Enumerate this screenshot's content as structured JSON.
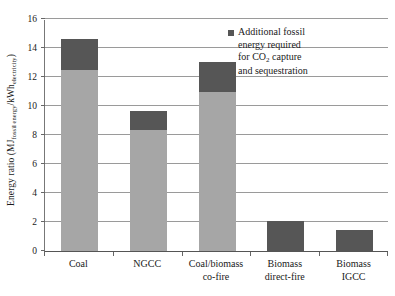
{
  "chart_data": {
    "type": "bar",
    "title": "",
    "xlabel": "",
    "ylabel": "Energy ratio (MJfossil energy/kWhelectricity)",
    "ylabel_parts": {
      "main_prefix": "Energy ratio (MJ",
      "sub1": "fossil energy",
      "mid": "/kWh",
      "sub2": "electricity",
      "suffix": ")"
    },
    "ylim": [
      0,
      16
    ],
    "yticks": [
      0,
      2,
      4,
      6,
      8,
      10,
      12,
      14,
      16
    ],
    "ytick_labels": [
      "0",
      "2",
      "4",
      "6",
      "8",
      "10",
      "12",
      "14",
      "16"
    ],
    "grid": true,
    "legend_position": "top-right",
    "categories": [
      "Coal",
      "NGCC",
      "Coal/biomass\nco-fire",
      "Biomass\ndirect-fire",
      "Biomass IGCC"
    ],
    "series": [
      {
        "name": "Base fossil energy",
        "color": "#a6a6a6",
        "values": [
          12.45,
          8.35,
          10.95,
          0,
          0
        ]
      },
      {
        "name": "Additional fossil energy required for CO2 capture and sequestration",
        "color": "#565656",
        "values": [
          2.15,
          1.3,
          2.1,
          2.1,
          1.48
        ]
      }
    ],
    "totals": [
      14.6,
      9.65,
      13.05,
      2.1,
      1.48
    ],
    "annotations": []
  },
  "legend": {
    "marker_color": "#565656",
    "line1": "Additional fossil",
    "line2": "energy required",
    "line3_prefix": "for CO",
    "line3_sub": "2",
    "line3_suffix": " capture",
    "line4": "and sequestration"
  },
  "colors": {
    "base_segment": "#a6a6a6",
    "capture_segment": "#565656",
    "gridline": "#9a9a9a",
    "axis": "#555555",
    "text": "#1a1a1a",
    "background": "#ffffff"
  }
}
